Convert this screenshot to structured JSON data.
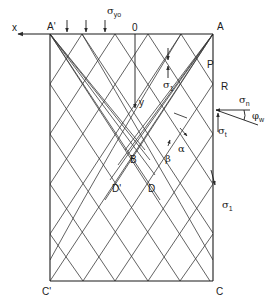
{
  "diagram": {
    "type": "slip-line field in bin/silo wall section",
    "frame": {
      "left": 50,
      "right": 213,
      "top": 34,
      "bottom": 281
    },
    "axes": {
      "x_label": "x",
      "y_label": "y",
      "origin_label": "0"
    },
    "corner_labels": {
      "top_left": "A'",
      "top_right": "A",
      "bottom_left": "C'",
      "bottom_right": "C"
    },
    "point_labels": {
      "P": "P",
      "R": "R",
      "B": "B",
      "D": "D",
      "D_prime": "D'"
    },
    "stress_labels": {
      "sigma_y0": "σ",
      "sigma_y0_sub": "yo",
      "sigma_1_top": "σ",
      "sigma_1_top_sub": "1",
      "sigma_n": "σ",
      "sigma_n_sub": "n",
      "sigma_t": "σ",
      "sigma_t_sub": "t",
      "phi_w": "φ",
      "phi_w_sub": "w",
      "sigma_1_wall": "σ",
      "sigma_1_wall_sub": "1"
    },
    "characteristic_labels": {
      "alpha": "α",
      "beta": "β"
    },
    "colors": {
      "line": "#2a2a2a",
      "background": "#ffffff"
    }
  }
}
